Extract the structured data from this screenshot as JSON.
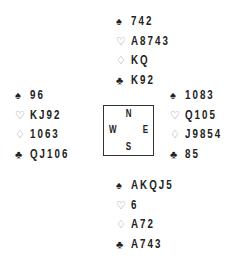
{
  "suit_symbols": {
    "spades": "♠",
    "hearts": "♡",
    "diamonds": "♢",
    "clubs": "♣"
  },
  "compass": {
    "north": "N",
    "west": "W",
    "east": "E",
    "south": "S"
  },
  "hands": {
    "north": {
      "spades": "742",
      "hearts": "A8743",
      "diamonds": "KQ",
      "clubs": "K92"
    },
    "west": {
      "spades": "96",
      "hearts": "KJ92",
      "diamonds": "1063",
      "clubs": "QJ106"
    },
    "east": {
      "spades": "1083",
      "hearts": "Q105",
      "diamonds": "J9854",
      "clubs": "85"
    },
    "south": {
      "spades": "AKQJ5",
      "hearts": "6",
      "diamonds": "A72",
      "clubs": "A743"
    }
  }
}
